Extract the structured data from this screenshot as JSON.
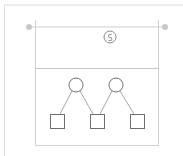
{
  "diagram": {
    "title_symbol": "S",
    "colors": {
      "frame": "#d9d9d9",
      "line": "#c8c8c8",
      "shape_stroke": "#707070",
      "connector": "#8a8a8a",
      "dot": "#c4c4c4",
      "background": "#ffffff"
    },
    "top_nodes": [
      {
        "id": "circle-1",
        "shape": "circle"
      },
      {
        "id": "circle-2",
        "shape": "circle"
      }
    ],
    "bottom_nodes": [
      {
        "id": "square-1",
        "shape": "square"
      },
      {
        "id": "square-2",
        "shape": "square"
      },
      {
        "id": "square-3",
        "shape": "square"
      }
    ],
    "edges": [
      {
        "from": "circle-1",
        "to": "square-1"
      },
      {
        "from": "circle-1",
        "to": "square-2"
      },
      {
        "from": "circle-2",
        "to": "square-2"
      },
      {
        "from": "circle-2",
        "to": "square-3"
      }
    ]
  }
}
